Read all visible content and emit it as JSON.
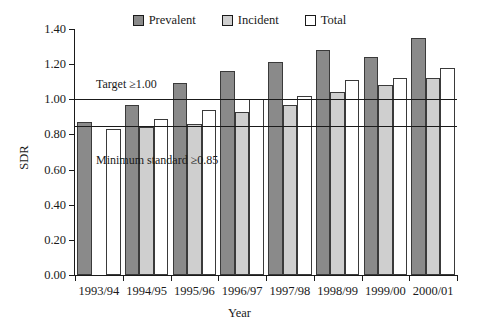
{
  "chart_data": {
    "type": "bar",
    "title": "",
    "xlabel": "Year",
    "ylabel": "SDR",
    "ylim": [
      0.0,
      1.4
    ],
    "ytick_labels": [
      "0.00",
      "0.20",
      "0.40",
      "0.60",
      "0.80",
      "1.00",
      "1.20",
      "1.40"
    ],
    "ytick_values": [
      0.0,
      0.2,
      0.4,
      0.6,
      0.8,
      1.0,
      1.2,
      1.4
    ],
    "grid": false,
    "legend_position": "top-center",
    "categories": [
      "1993/94",
      "1994/95",
      "1995/96",
      "1996/97",
      "1997/98",
      "1998/99",
      "1999/00",
      "2000/01"
    ],
    "series": [
      {
        "name": "Prevalent",
        "color": "#8a8a8a",
        "values": [
          0.87,
          0.97,
          1.09,
          1.16,
          1.21,
          1.28,
          1.24,
          1.35
        ]
      },
      {
        "name": "Incident",
        "color": "#cfcfcf",
        "values": [
          null,
          0.84,
          0.86,
          0.93,
          0.97,
          1.04,
          1.08,
          1.12
        ]
      },
      {
        "name": "Total",
        "color": "#ffffff",
        "values": [
          0.83,
          0.89,
          0.94,
          1.0,
          1.02,
          1.11,
          1.12,
          1.18
        ]
      }
    ],
    "reference_lines": [
      {
        "label": "Target ≥1.00",
        "value": 1.0
      },
      {
        "label": "Minimum standard ≥0.85",
        "value": 0.85
      }
    ],
    "annotations": [
      {
        "text": "Target ≥1.00",
        "x_frac": 0.055,
        "y_value": 1.085
      },
      {
        "text": "Minimum standard ≥0.85",
        "x_frac": 0.055,
        "y_value": 0.655
      }
    ]
  },
  "legend": {
    "items": [
      {
        "label": "Prevalent"
      },
      {
        "label": "Incident"
      },
      {
        "label": "Total"
      }
    ]
  },
  "axes": {
    "y_title": "SDR",
    "x_title": "Year"
  }
}
